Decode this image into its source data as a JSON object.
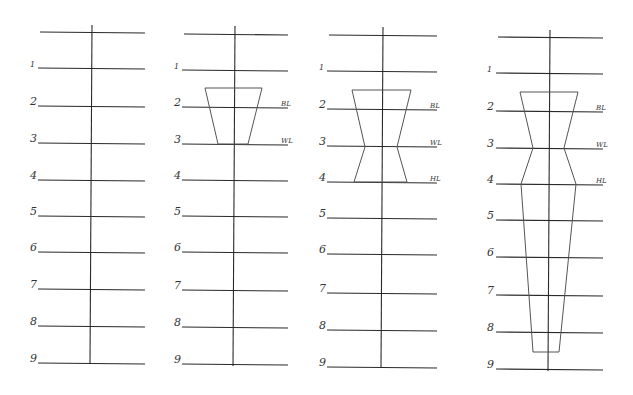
{
  "colors": {
    "background": "#ffffff",
    "line": "#2a2a2a",
    "shape": "#555555"
  },
  "row_labels": [
    "1",
    "2",
    "3",
    "4",
    "5",
    "6",
    "7",
    "8",
    "9"
  ],
  "markers": {
    "bust": "BL",
    "waist": "WL",
    "hip": "HL"
  },
  "panels": [
    {
      "id": "step-1",
      "center_x": 91,
      "line_x1": 38,
      "line_x2": 145,
      "top_y": 32,
      "rows_y": [
        68,
        106,
        143,
        180,
        216,
        252,
        289,
        326,
        363
      ],
      "vline_top": 25,
      "vline_bottom": 364,
      "label_x": 30,
      "markers": [],
      "shape": []
    },
    {
      "id": "step-2",
      "center_x": 234,
      "line_x1": 182,
      "line_x2": 288,
      "top_y": 34,
      "rows_y": [
        70,
        107,
        144,
        180,
        216,
        252,
        290,
        327,
        364
      ],
      "vline_top": 26,
      "vline_bottom": 366,
      "label_x": 174,
      "markers": [
        {
          "label": "BL",
          "row": 1
        },
        {
          "label": "WL",
          "row": 2
        }
      ],
      "shape": [
        [
          205,
          88
        ],
        [
          262,
          88
        ],
        [
          248,
          144
        ],
        [
          218,
          144
        ],
        [
          205,
          88
        ]
      ]
    },
    {
      "id": "step-3",
      "center_x": 382,
      "line_x1": 327,
      "line_x2": 437,
      "top_y": 35,
      "rows_y": [
        71,
        109,
        146,
        182,
        218,
        254,
        293,
        330,
        367
      ],
      "vline_top": 27,
      "vline_bottom": 368,
      "label_x": 319,
      "markers": [
        {
          "label": "BL",
          "row": 1
        },
        {
          "label": "WL",
          "row": 2
        },
        {
          "label": "HL",
          "row": 3
        }
      ],
      "shape": [
        [
          352,
          90
        ],
        [
          411,
          90
        ],
        [
          397,
          147
        ],
        [
          407,
          182
        ],
        [
          354,
          182
        ],
        [
          365,
          147
        ],
        [
          352,
          90
        ]
      ]
    },
    {
      "id": "step-4",
      "center_x": 549,
      "line_x1": 496,
      "line_x2": 603,
      "top_y": 37,
      "rows_y": [
        73,
        111,
        148,
        184,
        220,
        257,
        295,
        332,
        369
      ],
      "vline_top": 30,
      "vline_bottom": 371,
      "label_x": 487,
      "markers": [
        {
          "label": "BL",
          "row": 1
        },
        {
          "label": "WL",
          "row": 2
        },
        {
          "label": "HL",
          "row": 3
        }
      ],
      "shape": [
        [
          520,
          92
        ],
        [
          578,
          92
        ],
        [
          564,
          148
        ],
        [
          576,
          184
        ],
        [
          559,
          352
        ],
        [
          533,
          352
        ],
        [
          521,
          184
        ],
        [
          533,
          148
        ],
        [
          520,
          92
        ]
      ]
    }
  ]
}
